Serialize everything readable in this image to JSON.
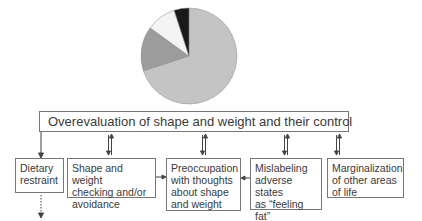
{
  "chart_data": {
    "type": "pie",
    "title": "",
    "values": [
      70,
      15,
      10,
      5
    ],
    "labels": [
      "Overevaluation of shape and weight",
      "Other domain 2",
      "Other domain 3",
      "Other domain 4"
    ],
    "colors": [
      "#c4c4c4",
      "#9c9c9c",
      "#f4f4f4",
      "#1a1a1a"
    ],
    "legend": false
  },
  "diagram": {
    "main_box": "Overevaluation of shape and weight and their control",
    "boxes": [
      {
        "id": "dietary",
        "lines": [
          "Dietary",
          "restraint"
        ]
      },
      {
        "id": "checking",
        "lines": [
          "Shape and weight",
          "checking and/or",
          "avoidance"
        ]
      },
      {
        "id": "preoccupation",
        "lines": [
          "Preoccupation",
          "with thoughts",
          "about shape",
          "and weight"
        ]
      },
      {
        "id": "mislabeling",
        "lines": [
          "Mislabeling",
          "adverse states",
          "as “feeling",
          "fat”"
        ]
      },
      {
        "id": "marginalization",
        "lines": [
          "Marginalization",
          "of other areas",
          "of life"
        ]
      }
    ]
  }
}
